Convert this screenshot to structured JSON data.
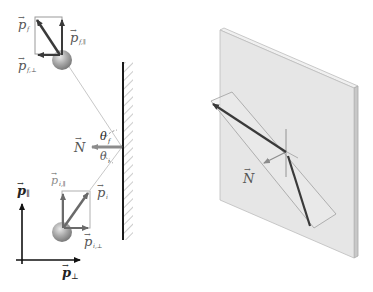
{
  "colors": {
    "background": "#ffffff",
    "wall": "#1a1a1a",
    "hatch": "#999999",
    "vector_dark": "#3a3a3a",
    "vector_light": "#888888",
    "component_rect": "#9a9a9a",
    "path_line": "#c8c8c8",
    "normal_arrow": "#8c8c8c",
    "plate_face": "#e6e6e6",
    "plate_edge": "#bdbdbd",
    "ball": "#a8a8a8"
  },
  "left_panel": {
    "final_state": {
      "vector_label": "p",
      "vector_subscript": "f",
      "parallel_label": "p",
      "parallel_subscript": "f,∥",
      "perpendicular_label": "p",
      "perpendicular_subscript": "f,⊥"
    },
    "initial_state": {
      "vector_label": "p",
      "vector_subscript": "i",
      "parallel_label": "p",
      "parallel_subscript": "i,∥",
      "perpendicular_label": "p",
      "perpendicular_subscript": "i,⊥"
    },
    "wall": {
      "normal_label": "N",
      "angle_reflection_label": "θ",
      "angle_reflection_subscript": "f",
      "angle_incidence_label": "θ",
      "angle_incidence_subscript": "i"
    },
    "axes": {
      "vertical_label": "p",
      "vertical_subscript": "∥",
      "horizontal_label": "p",
      "horizontal_subscript": "⊥"
    }
  },
  "right_panel": {
    "normal_label": "N",
    "vector_arrow_glyph": "→"
  }
}
